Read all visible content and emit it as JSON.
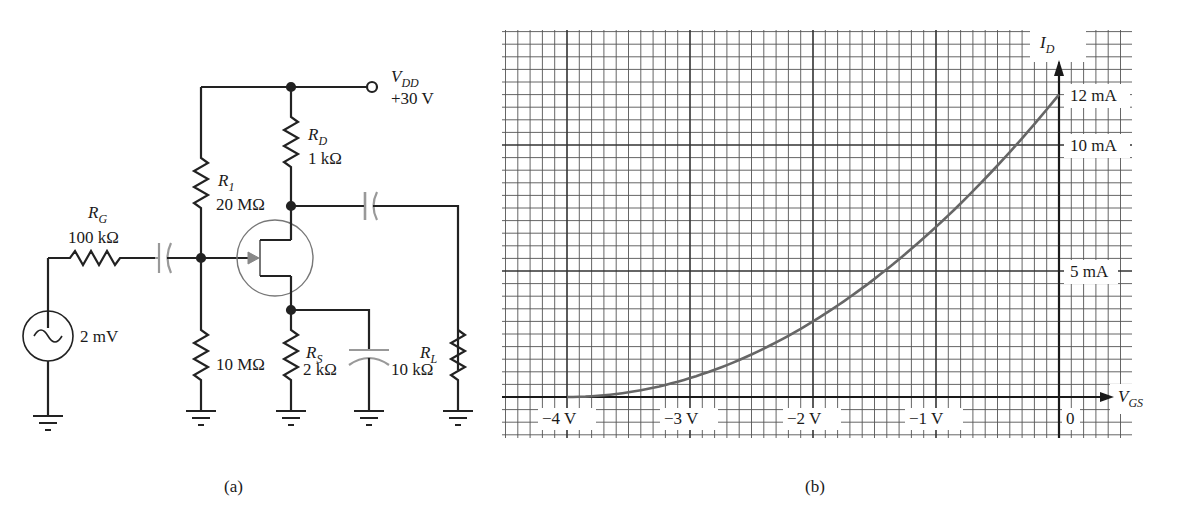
{
  "figure_a": {
    "caption": "(a)",
    "source": {
      "name": "source",
      "value": "2 mV"
    },
    "RG": {
      "name": "R",
      "sub": "G",
      "value": "100 kΩ"
    },
    "R1": {
      "name": "R",
      "sub": "1",
      "value": "20 MΩ"
    },
    "R2": {
      "value": "10 MΩ"
    },
    "RD": {
      "name": "R",
      "sub": "D",
      "value": "1 kΩ"
    },
    "RS": {
      "name": "R",
      "sub": "S",
      "value": "2 kΩ"
    },
    "RL": {
      "name": "R",
      "sub": "L",
      "value": "10 kΩ"
    },
    "VDD": {
      "name": "V",
      "sub": "DD",
      "value": "+30 V"
    }
  },
  "figure_b": {
    "caption": "(b)",
    "y_axis": {
      "name": "I",
      "sub": "D"
    },
    "x_axis": {
      "name": "V",
      "sub": "GS"
    },
    "y_ticks": [
      "12 mA",
      "10 mA",
      "5 mA"
    ],
    "x_ticks": [
      "−4 V",
      "−3 V",
      "−2 V",
      "−1 V",
      "0"
    ]
  },
  "chart_data": {
    "type": "line",
    "xlabel": "V_GS",
    "ylabel": "I_D",
    "x_unit": "V",
    "y_unit": "mA",
    "xlim": [
      -4.5,
      0.6
    ],
    "ylim": [
      0,
      12.5
    ],
    "grid": true,
    "x_tick_labels": [
      "−4 V",
      "−3 V",
      "−2 V",
      "−1 V",
      "0"
    ],
    "y_tick_labels": [
      "5 mA",
      "10 mA",
      "12 mA"
    ],
    "series": [
      {
        "name": "I_D",
        "x": [
          -4,
          -3.5,
          -3,
          -2.5,
          -2,
          -1.5,
          -1,
          -0.5,
          0
        ],
        "y": [
          0,
          0.19,
          0.75,
          1.69,
          3.0,
          4.69,
          6.75,
          9.19,
          12.0
        ]
      }
    ],
    "IDSS_mA": 12,
    "VGS_off_V": -4
  }
}
